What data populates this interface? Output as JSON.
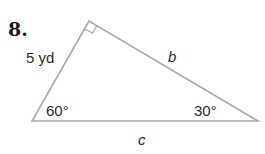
{
  "problem": {
    "number": "8."
  },
  "triangle": {
    "vertices": {
      "top": [
        89,
        21
      ],
      "bottom_left": [
        32,
        121
      ],
      "bottom_right": [
        258,
        121
      ]
    },
    "right_angle_at": "top",
    "stroke_color": "#a8a8a8",
    "labels": {
      "side_left": "5 yd",
      "side_hyp_top": "b",
      "side_bottom": "c",
      "angle_bottom_left": "60°",
      "angle_bottom_right": "30°"
    }
  }
}
